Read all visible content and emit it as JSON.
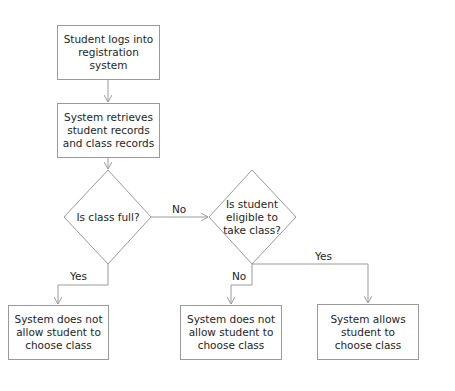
{
  "colors": {
    "line": "#9a9a9a",
    "text": "#1e1e1e",
    "background": "#ffffff"
  },
  "nodes": {
    "login": {
      "label": "Student logs into registration system",
      "type": "process"
    },
    "retrieve": {
      "label": "System retrieves student records and class records",
      "type": "process"
    },
    "class_full": {
      "label": "Is class full?",
      "type": "decision"
    },
    "eligible": {
      "label": "Is student eligible to take class?",
      "type": "decision"
    },
    "deny_full": {
      "label": "System does not allow student to choose class",
      "type": "process"
    },
    "deny_ineligible": {
      "label": "System does not allow student to choose class",
      "type": "process"
    },
    "allow": {
      "label": "System allows student to choose class",
      "type": "process"
    }
  },
  "edges": {
    "full_no": {
      "from": "class_full",
      "to": "eligible",
      "label": "No"
    },
    "full_yes": {
      "from": "class_full",
      "to": "deny_full",
      "label": "Yes"
    },
    "eligible_no": {
      "from": "eligible",
      "to": "deny_ineligible",
      "label": "No"
    },
    "eligible_yes": {
      "from": "eligible",
      "to": "allow",
      "label": "Yes"
    }
  }
}
